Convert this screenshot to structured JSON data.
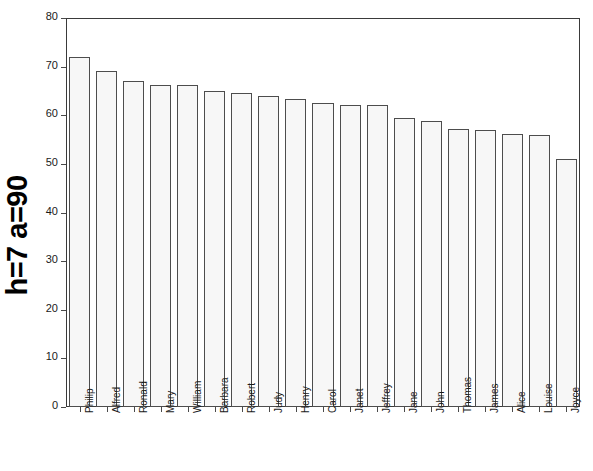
{
  "chart_data": {
    "type": "bar",
    "title": "",
    "subtitle": "",
    "xlabel": "",
    "ylabel": "h=7 a=90",
    "ylim": [
      0,
      80
    ],
    "yticks": [
      0,
      10,
      20,
      30,
      40,
      50,
      60,
      70,
      80
    ],
    "grid": false,
    "legend": null,
    "bar_fill_color": "#f7f7f7",
    "bar_edge_color": "#4d4d4d",
    "axis_color": "#3a3a3a",
    "background_color": "#ffffff",
    "categories": [
      "Philip",
      "Alfred",
      "Ronald",
      "Mary",
      "William",
      "Barbara",
      "Robert",
      "Judy",
      "Henry",
      "Carol",
      "Janet",
      "Jeffrey",
      "Jane",
      "John",
      "Thomas",
      "James",
      "Alice",
      "Louise",
      "Joyce"
    ],
    "values": [
      72,
      69,
      67,
      66.2,
      66.2,
      65,
      64.5,
      64,
      63.3,
      62.5,
      62.2,
      62.2,
      59.5,
      58.8,
      57.2,
      57,
      56.2,
      56,
      51
    ]
  },
  "axis": {
    "y_title": "h=7 a=90"
  }
}
